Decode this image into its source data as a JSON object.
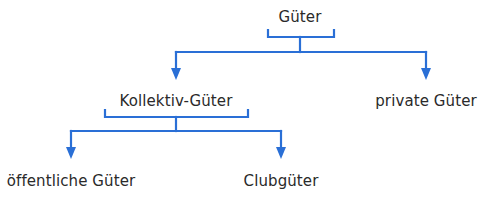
{
  "colors": {
    "line": "#2a6fd6",
    "text": "#2a2a2a",
    "background": "#ffffff"
  },
  "tree": {
    "root": {
      "label": "Güter"
    },
    "level1": [
      {
        "label": "Kollektiv-Güter"
      },
      {
        "label": "private Güter"
      }
    ],
    "level2": [
      {
        "label": "öffentliche Güter"
      },
      {
        "label": "Clubgüter"
      }
    ]
  }
}
